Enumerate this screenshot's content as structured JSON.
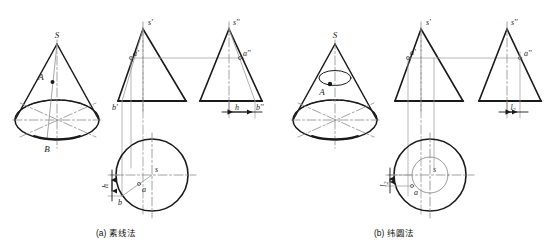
{
  "figure": {
    "title_visible": false,
    "colors": {
      "outline": "#1a1a1a",
      "thin_construction": "#9a9a9a",
      "centerline": "#8a8a8a",
      "hidden": "#1a1a1a",
      "background": "#ffffff"
    },
    "panels": [
      {
        "id": "a",
        "caption": "(a) 素线法",
        "caption_label": "(a)",
        "caption_text": "素线法",
        "views": {
          "pictorial": {
            "name": "3D cone pictorial",
            "labels": [
              {
                "text": "S",
                "role": "apex"
              },
              {
                "text": "A",
                "role": "point-on-surface"
              },
              {
                "text": "B",
                "role": "base-point"
              }
            ]
          },
          "front": {
            "name": "front view triangle",
            "labels": [
              {
                "text": "s'",
                "role": "apex-front"
              },
              {
                "text": "a'",
                "role": "point-front"
              },
              {
                "text": "b'",
                "role": "base-point-front"
              }
            ]
          },
          "side": {
            "name": "side view triangle",
            "labels": [
              {
                "text": "s\"",
                "role": "apex-side"
              },
              {
                "text": "a\"",
                "role": "point-side"
              },
              {
                "text": "b\"",
                "role": "base-point-side"
              }
            ],
            "dimension": {
              "text": "h",
              "role": "width-dimension"
            }
          },
          "top": {
            "name": "top view circle",
            "labels": [
              {
                "text": "s",
                "role": "apex-top"
              },
              {
                "text": "a",
                "role": "point-top"
              },
              {
                "text": "b",
                "role": "base-point-top"
              }
            ],
            "dimension": {
              "text": "h",
              "role": "depth-dimension"
            }
          }
        }
      },
      {
        "id": "b",
        "caption": "(b) 纬圆法",
        "caption_label": "(b)",
        "caption_text": "纬圆法",
        "views": {
          "pictorial": {
            "name": "3D cone pictorial",
            "labels": [
              {
                "text": "S",
                "role": "apex"
              },
              {
                "text": "A",
                "role": "point-on-surface"
              }
            ]
          },
          "front": {
            "name": "front view triangle",
            "labels": [
              {
                "text": "s'",
                "role": "apex-front"
              },
              {
                "text": "a'",
                "role": "point-front"
              }
            ]
          },
          "side": {
            "name": "side view triangle",
            "labels": [
              {
                "text": "s\"",
                "role": "apex-side"
              },
              {
                "text": "a\"",
                "role": "point-side"
              }
            ],
            "dimension": {
              "text": "l₂",
              "role": "width-dimension"
            }
          },
          "top": {
            "name": "top view circles",
            "labels": [
              {
                "text": "s",
                "role": "apex-top"
              },
              {
                "text": "a",
                "role": "point-top"
              }
            ],
            "dimension": {
              "text": "l₂",
              "role": "depth-dimension"
            }
          }
        }
      }
    ]
  }
}
